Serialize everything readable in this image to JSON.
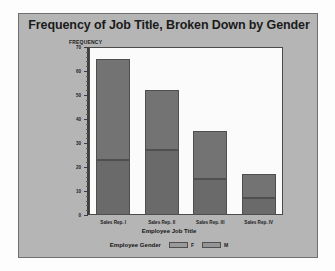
{
  "chart_data": {
    "type": "bar",
    "subtype": "stacked",
    "title": "Frequency of Job Title, Broken Down by Gender",
    "xlabel": "Employee Job Title",
    "ylabel": "FREQUENCY",
    "categories": [
      "Sales Rep. I",
      "Sales Rep. II",
      "Sales Rep. III",
      "Sales Rep. IV"
    ],
    "series": [
      {
        "name": "F",
        "values": [
          42,
          25,
          20,
          10
        ],
        "color": "#737373"
      },
      {
        "name": "M",
        "values": [
          23,
          27,
          15,
          7
        ],
        "color": "#6a6a6a"
      }
    ],
    "stack_totals": [
      65,
      52,
      35,
      17
    ],
    "ylim": [
      0,
      70
    ],
    "yticks": [
      0,
      10,
      20,
      30,
      40,
      50,
      60,
      70
    ],
    "ytick_labels": [
      "0",
      "10",
      "20",
      "30",
      "40",
      "50",
      "60",
      "70"
    ],
    "grid": false,
    "legend_title": "Employee Gender",
    "legend_position": "bottom",
    "legend_entries": [
      "F",
      "M"
    ],
    "panel_color": "#b5b5b5",
    "plot_background": "#fbfbfb"
  }
}
